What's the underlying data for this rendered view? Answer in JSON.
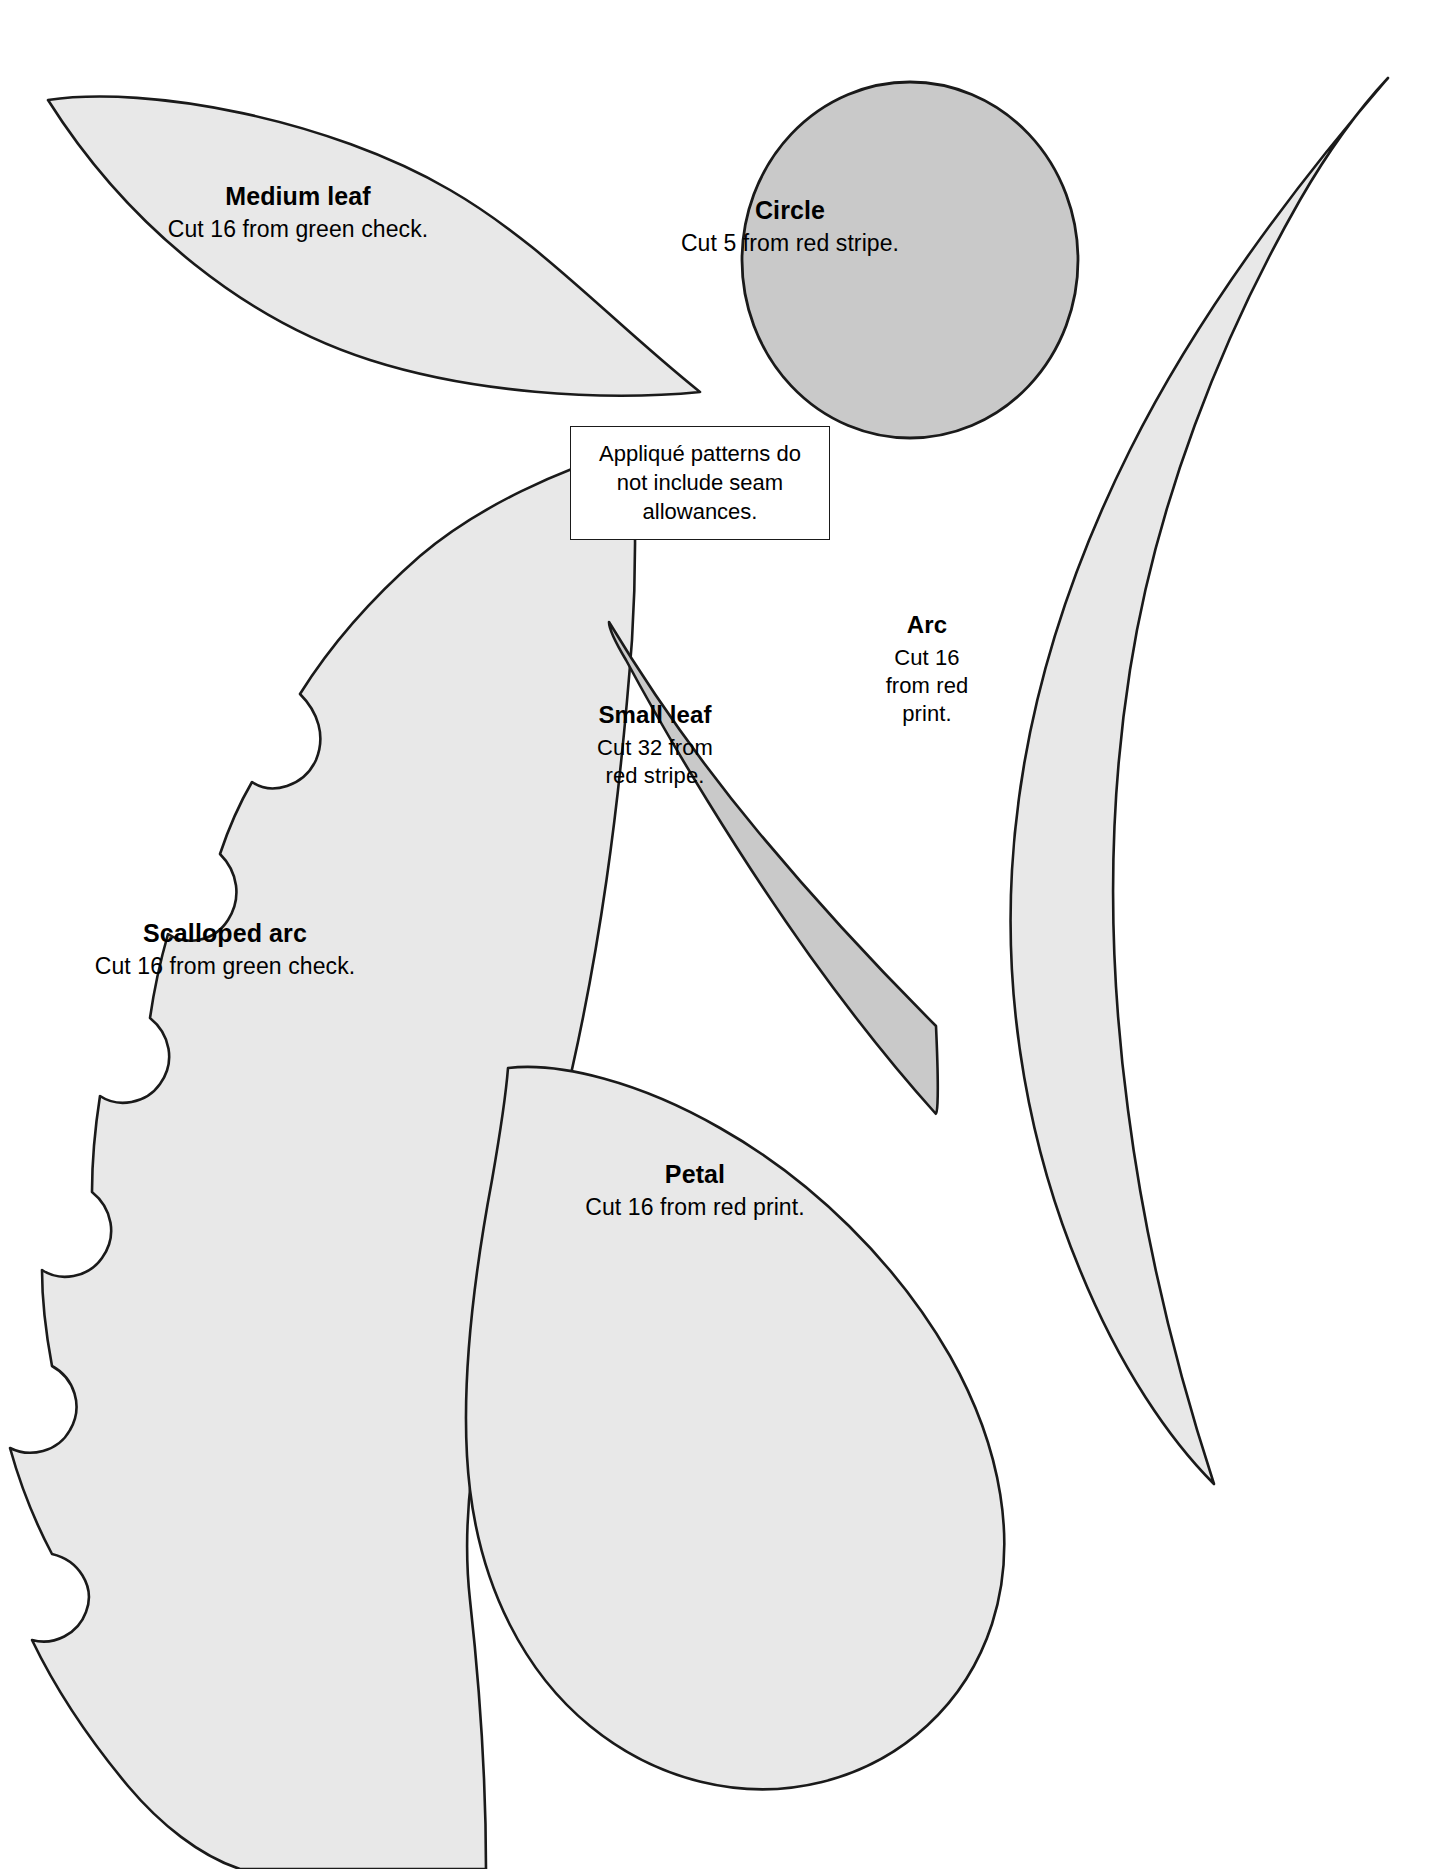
{
  "document": {
    "type": "applique-pattern-template-sheet",
    "background_color": "#ffffff",
    "outline_color": "#1a1a1a"
  },
  "note": {
    "text": "Appliqué patterns do not include seam allowances."
  },
  "fills": {
    "light_gray": "#e8e8e8",
    "medium_gray": "#c9c9c9",
    "dark_gray": "#c4c4c4"
  },
  "shapes": [
    {
      "id": "medium-leaf",
      "title": "Medium leaf",
      "desc": "Cut 16 from green check.",
      "fill": "#e8e8e8"
    },
    {
      "id": "circle",
      "title": "Circle",
      "desc": "Cut 5 from red stripe.",
      "fill": "#c9c9c9"
    },
    {
      "id": "scalloped-arc",
      "title": "Scalloped arc",
      "desc": "Cut 16 from green check.",
      "fill": "#e8e8e8"
    },
    {
      "id": "small-leaf",
      "title": "Small leaf",
      "desc_line1": "Cut 32 from",
      "desc_line2": "red stripe.",
      "fill": "#c9c9c9"
    },
    {
      "id": "arc",
      "title": "Arc",
      "desc_line1": "Cut 16",
      "desc_line2": "from red",
      "desc_line3": "print.",
      "fill": "#e8e8e8"
    },
    {
      "id": "petal",
      "title": "Petal",
      "desc": "Cut 16 from red print.",
      "fill": "#e8e8e8"
    }
  ]
}
